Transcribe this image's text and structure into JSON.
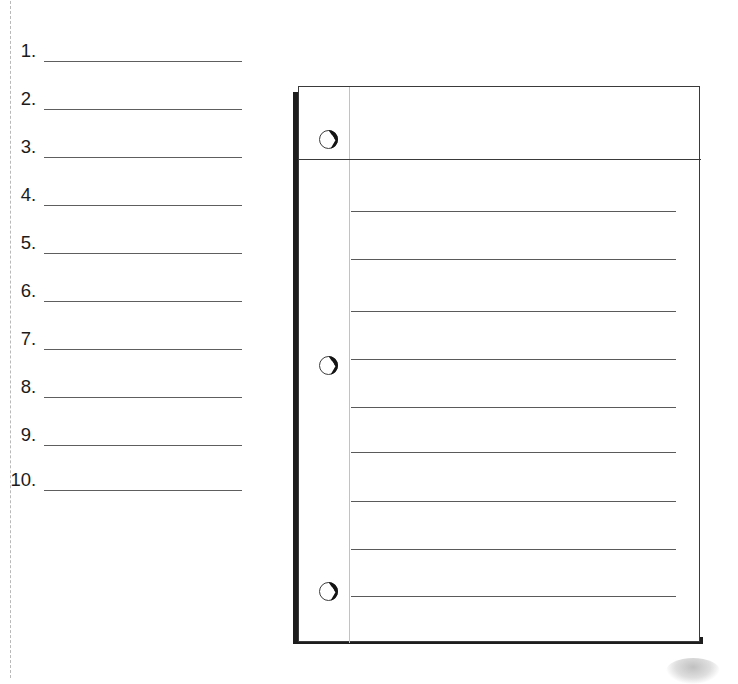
{
  "document": {
    "background_color": "#ffffff",
    "width": 738,
    "height": 674
  },
  "cut_line": {
    "style": "dashed",
    "orientation": "vertical",
    "color": "#b9b9b9",
    "x": 10
  },
  "answer_list": {
    "name": "numbered-answer-blanks",
    "count": 10,
    "rule_color": "#5e5e5e",
    "items": [
      {
        "number": "1."
      },
      {
        "number": "2."
      },
      {
        "number": "3."
      },
      {
        "number": "4."
      },
      {
        "number": "5."
      },
      {
        "number": "6."
      },
      {
        "number": "7."
      },
      {
        "number": "8."
      },
      {
        "number": "9."
      },
      {
        "number": "10."
      }
    ],
    "row_tops": [
      36,
      84,
      132,
      180,
      228,
      276,
      324,
      372,
      420,
      465
    ]
  },
  "notebook": {
    "name": "lined-notebook-page",
    "spine_color": "#1d1d1d",
    "sheet_border_color": "#3a3a3a",
    "margin_rule_color": "#c2c2c2",
    "header_rule_color": "#3a3a3a",
    "rule_line_color": "#5a5a5a",
    "header_rule_top": 72,
    "rule_line_tops": [
      124,
      172,
      224,
      272,
      320,
      365,
      414,
      462,
      509
    ],
    "holes": [
      {
        "label": "hole-top",
        "top": 43,
        "left": 20
      },
      {
        "label": "hole-middle",
        "top": 269,
        "left": 20
      },
      {
        "label": "hole-bottom",
        "top": 495,
        "left": 20
      }
    ]
  },
  "smudge": {
    "name": "page-smudge",
    "color": "#b5b5b5"
  }
}
